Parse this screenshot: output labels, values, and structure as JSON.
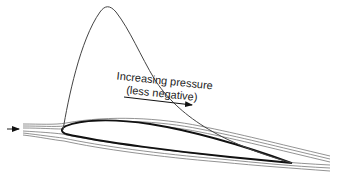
{
  "diagram": {
    "title": "",
    "annotation": {
      "line1": "Increasing pressure",
      "line2": "(less negative)"
    },
    "elements": {
      "airfoil": "airfoil",
      "pressure_curve": "pressure-distribution-curve",
      "streamlines": "streamlines",
      "freestream_arrow": "freestream-arrow",
      "pressure_arrow": "increasing-pressure-arrow"
    },
    "colors": {
      "airfoil": "#111111",
      "curve": "#444444",
      "streamline": "#777777",
      "text": "#222222"
    }
  }
}
